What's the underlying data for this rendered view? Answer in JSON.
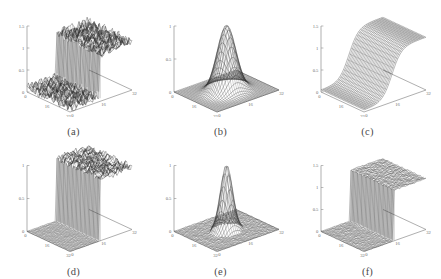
{
  "figure": {
    "background_color": "#ffffff",
    "mesh_color": "#2e2e2e",
    "axis_color": "#8d8d8d",
    "rows": 2,
    "columns": 3
  },
  "panels": [
    {
      "caption": "(a)",
      "surface": "noisy-step",
      "zticks": [
        "1.5",
        "1",
        "0.5",
        "0"
      ],
      "zlim": [
        0,
        1.5
      ],
      "xticks": [
        "0",
        "16",
        "32"
      ],
      "yticks": [
        "0",
        "16",
        "32"
      ],
      "base_shaded": false
    },
    {
      "caption": "(b)",
      "surface": "smooth-gaussian",
      "zticks": [
        "1",
        "0.5",
        "0"
      ],
      "zlim": [
        0,
        1
      ],
      "xticks": [
        "0",
        "16",
        "32"
      ],
      "yticks": [
        "0",
        "16",
        "32"
      ],
      "base_shaded": false
    },
    {
      "caption": "(c)",
      "surface": "smooth-sigmoid",
      "zticks": [
        "1.5",
        "1",
        "0.5",
        "0"
      ],
      "zlim": [
        0,
        1.5
      ],
      "xticks": [
        "0",
        "16",
        "32"
      ],
      "yticks": [
        "0",
        "16",
        "32"
      ],
      "base_shaded": false
    },
    {
      "caption": "(d)",
      "surface": "noisy-step-dark-base",
      "zticks": [
        "1",
        "0.5",
        "0"
      ],
      "zlim": [
        0,
        1
      ],
      "xticks": [
        "0",
        "16",
        "32"
      ],
      "yticks": [
        "0",
        "16",
        "32"
      ],
      "base_shaded": true
    },
    {
      "caption": "(e)",
      "surface": "sharp-gaussian-dark-base",
      "zticks": [
        "1",
        "0.5",
        "0"
      ],
      "zlim": [
        0,
        1
      ],
      "xticks": [
        "0",
        "16",
        "32"
      ],
      "yticks": [
        "0",
        "16",
        "32"
      ],
      "base_shaded": true
    },
    {
      "caption": "(f)",
      "surface": "clean-step-dark-base",
      "zticks": [
        "1.5",
        "1",
        "0.5",
        "0"
      ],
      "zlim": [
        0,
        1.5
      ],
      "xticks": [
        "0",
        "16",
        "32"
      ],
      "yticks": [
        "0",
        "16",
        "32"
      ],
      "base_shaded": true
    }
  ],
  "chart_data": {
    "type": "line",
    "title": "",
    "xlabel": "",
    "ylabel": "",
    "subplot_layout": [
      2,
      3
    ],
    "shared_xlim": [
      0,
      32
    ],
    "shared_ylim": [
      0,
      32
    ],
    "grid": false,
    "legend": null,
    "subplots": [
      {
        "label": "(a)",
        "type": "surface",
        "function": "noisy step edge along x",
        "zlim": [
          0,
          1.5
        ],
        "zticks": [
          0,
          0.5,
          1,
          1.5
        ],
        "xticks": [
          0,
          16,
          32
        ],
        "yticks": [
          0,
          16,
          32
        ],
        "plateau_low": 0.1,
        "plateau_high": 1.1,
        "noise_amplitude": 0.13,
        "grid_n": 32
      },
      {
        "label": "(b)",
        "type": "surface",
        "function": "2D Gaussian peak",
        "zlim": [
          0,
          1
        ],
        "zticks": [
          0,
          0.5,
          1
        ],
        "xticks": [
          0,
          16,
          32
        ],
        "yticks": [
          0,
          16,
          32
        ],
        "peak_value": 1.0,
        "peak_x": 16,
        "peak_y": 16,
        "sigma": 4.0,
        "noise_amplitude": 0.0,
        "grid_n": 32
      },
      {
        "label": "(c)",
        "type": "surface",
        "function": "smooth sigmoid ramp along x",
        "zlim": [
          0,
          1.5
        ],
        "zticks": [
          0,
          0.5,
          1,
          1.5
        ],
        "xticks": [
          0,
          16,
          32
        ],
        "yticks": [
          0,
          16,
          32
        ],
        "plateau_low": 0.05,
        "plateau_high": 1.15,
        "noise_amplitude": 0.0,
        "grid_n": 32
      },
      {
        "label": "(d)",
        "type": "surface",
        "function": "noisy step with flat dark base",
        "zlim": [
          0,
          1
        ],
        "zticks": [
          0,
          0.5,
          1
        ],
        "xticks": [
          0,
          16,
          32
        ],
        "yticks": [
          0,
          16,
          32
        ],
        "plateau_low": 0.0,
        "plateau_high": 0.95,
        "noise_amplitude": 0.09,
        "grid_n": 32
      },
      {
        "label": "(e)",
        "type": "surface",
        "function": "sharp Gaussian peak with dark base",
        "zlim": [
          0,
          1
        ],
        "zticks": [
          0,
          0.5,
          1
        ],
        "xticks": [
          0,
          16,
          32
        ],
        "yticks": [
          0,
          16,
          32
        ],
        "peak_value": 1.0,
        "peak_x": 16,
        "peak_y": 16,
        "sigma": 2.6,
        "noise_amplitude": 0.02,
        "grid_n": 32
      },
      {
        "label": "(f)",
        "type": "surface",
        "function": "clean step with dark base",
        "zlim": [
          0,
          1.5
        ],
        "zticks": [
          0,
          0.5,
          1,
          1.5
        ],
        "xticks": [
          0,
          16,
          32
        ],
        "yticks": [
          0,
          16,
          32
        ],
        "plateau_low": 0.0,
        "plateau_high": 1.15,
        "noise_amplitude": 0.02,
        "grid_n": 32
      }
    ]
  }
}
